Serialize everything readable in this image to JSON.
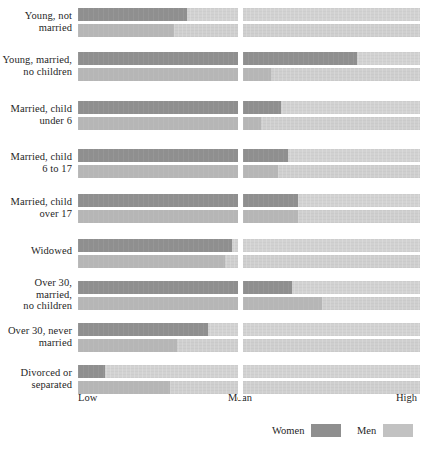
{
  "chart_data": {
    "type": "bar",
    "title": "",
    "subtitle": "",
    "xlabel": "",
    "ylabel": "",
    "orientation": "horizontal",
    "grid": false,
    "legend_position": "bottom-right",
    "axis_ticks": [
      "Low",
      "Mean",
      "High"
    ],
    "axis_tick_fractions": [
      0.0,
      0.47,
      1.0
    ],
    "xlim": [
      0,
      1
    ],
    "note": "Each life-stage category shows two stacked horizontal bars: the upper bar is Women, the lower bar is Men. Value is the length of the darker filled segment as a fraction from Low (0) to High (1); the Mean gridline falls at fraction 0.47.",
    "categories": [
      "Young, not married",
      "Young, married, no children",
      "Married, child under 6",
      "Married, child 6 to 17",
      "Married, child over 17",
      "Widowed",
      "Over 30, married, no children",
      "Over 30, never married",
      "Divorced or separated"
    ],
    "category_labels_lines": [
      [
        "Young, not",
        "married"
      ],
      [
        "Young, married,",
        "no children"
      ],
      [
        "Married, child",
        "under 6"
      ],
      [
        "Married, child",
        "6 to 17"
      ],
      [
        "Married, child",
        "over 17"
      ],
      [
        "Widowed"
      ],
      [
        "Over 30,",
        "married,",
        "no children"
      ],
      [
        "Over 30, never",
        "married"
      ],
      [
        "Divorced or",
        "separated"
      ]
    ],
    "series": [
      {
        "name": "Women",
        "color": "#8f8f8f",
        "values": [
          0.32,
          0.8,
          0.58,
          0.6,
          0.63,
          0.45,
          0.61,
          0.38,
          0.08
        ]
      },
      {
        "name": "Men",
        "color": "#b6b6b6",
        "values": [
          0.28,
          0.55,
          0.52,
          0.57,
          0.63,
          0.43,
          0.7,
          0.29,
          0.27
        ]
      }
    ],
    "track_color": "#d2d2d2"
  },
  "legend": {
    "women_label": "Women",
    "men_label": "Men"
  },
  "axis": {
    "low_label": "Low",
    "mean_label": "Mean",
    "high_label": "High"
  }
}
